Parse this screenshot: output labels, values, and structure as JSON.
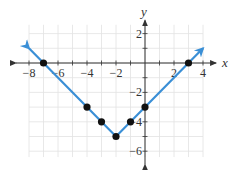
{
  "chart_data": {
    "type": "line",
    "title": "",
    "xlabel": "x",
    "ylabel": "y",
    "xlim": [
      -8,
      4
    ],
    "ylim": [
      -6,
      2
    ],
    "grid": true,
    "x_ticks": [
      -8,
      -6,
      -4,
      -2,
      2,
      4
    ],
    "y_ticks": [
      2,
      -2,
      -4,
      -6
    ],
    "x_tick_labels": [
      "−8",
      "−6",
      "−4",
      "−2",
      "2",
      "4"
    ],
    "y_tick_labels": [
      "2",
      "−2",
      "−4",
      "−6"
    ],
    "series": [
      {
        "name": "y = |x + 2| - 5",
        "color": "#3a8fd6",
        "line": {
          "x": [
            -8,
            -2,
            4
          ],
          "y": [
            1,
            -5,
            1
          ],
          "arrows": "both"
        },
        "points": {
          "x": [
            -7,
            -4,
            -3,
            -2,
            -1,
            0,
            3
          ],
          "y": [
            0,
            -3,
            -4,
            -5,
            -4,
            -3,
            0
          ]
        }
      }
    ]
  },
  "colors": {
    "line": "#3a8fd6",
    "point": "#111111",
    "grid": "#e2e2e2",
    "axis": "#333333"
  }
}
